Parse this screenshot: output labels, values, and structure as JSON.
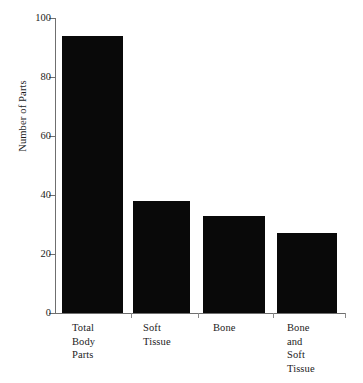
{
  "figure": {
    "background_color": "#ffffff",
    "axis_color": "#6f6f6f",
    "bar_color": "#090909",
    "text_color": "#1c1c1c"
  },
  "chart_data": {
    "type": "bar",
    "title": "",
    "subtitle": "",
    "xlabel": "",
    "ylabel": "Number of Parts",
    "categories": [
      "Total\nBody\nParts",
      "Soft\nTissue",
      "Bone",
      "Bone\nand\nSoft\nTissue"
    ],
    "values": [
      94,
      38,
      33,
      27
    ],
    "ylim": [
      0,
      100
    ],
    "yticks": [
      0,
      20,
      40,
      60,
      80,
      100
    ],
    "ytick_labels": [
      "0",
      "20",
      "40",
      "60",
      "80",
      "100"
    ],
    "grid": false,
    "legend": false,
    "legend_position": "none",
    "bar_color": "#090909",
    "annotations": []
  }
}
